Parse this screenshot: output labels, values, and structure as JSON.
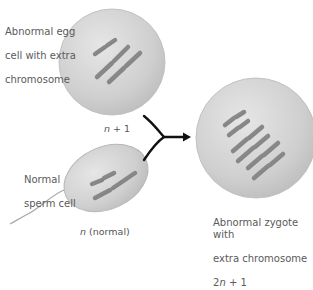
{
  "figure": {
    "egg": {
      "label_lines": [
        "Abnormal egg",
        "cell with extra",
        "chromosome"
      ],
      "caption": {
        "italic": "n",
        "rest": " + 1"
      }
    },
    "sperm": {
      "label_lines": [
        "Normal",
        "sperm cell"
      ],
      "caption": {
        "italic": "n",
        "rest": " (normal)"
      }
    },
    "zygote": {
      "label_lines": [
        "Abnormal zygote with",
        "extra chromosome"
      ],
      "caption": {
        "prefix": "2",
        "italic": "n",
        "rest": " + 1"
      }
    },
    "colors": {
      "cell_fill": "#cfcfcf",
      "cell_edge": "#b5b5b5",
      "chromosome": "#8a8a8a",
      "chromosome_edge": "#6e6e6e",
      "arrow": "#111111"
    }
  }
}
